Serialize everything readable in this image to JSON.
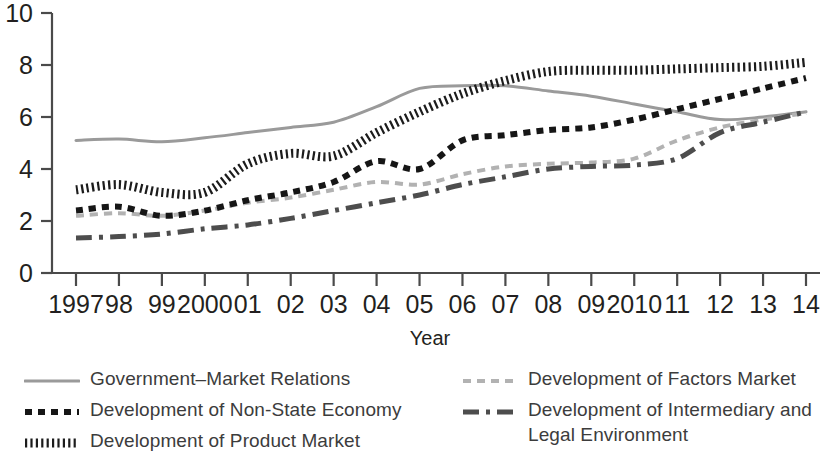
{
  "chart_data": {
    "type": "line",
    "title": "",
    "xlabel": "Year",
    "ylabel": "",
    "x": [
      1997,
      1998,
      1999,
      2000,
      2001,
      2002,
      2003,
      2004,
      2005,
      2006,
      2007,
      2008,
      2009,
      2010,
      2011,
      2012,
      2013,
      2014
    ],
    "categories": [
      "1997",
      "98",
      "99",
      "2000",
      "01",
      "02",
      "03",
      "04",
      "05",
      "06",
      "07",
      "08",
      "09",
      "2010",
      "11",
      "12",
      "13",
      "14"
    ],
    "xtick_labels": [
      "1997",
      "98",
      "99",
      "2000",
      "01",
      "02",
      "03",
      "04",
      "05",
      "06",
      "07",
      "08",
      "09",
      "2010",
      "11",
      "12",
      "13",
      "14"
    ],
    "ytick_labels": [
      "0",
      "2",
      "4",
      "6",
      "8",
      "10"
    ],
    "yticks": [
      0,
      2,
      4,
      6,
      8,
      10
    ],
    "ylim": [
      0,
      10
    ],
    "grid": false,
    "legend_position": "below-two-columns",
    "series": [
      {
        "name": "Government-Market Relations",
        "style": "solid",
        "color": "#9a9a9a",
        "width": 3,
        "values": [
          5.1,
          5.15,
          5.05,
          5.2,
          5.4,
          5.6,
          5.8,
          6.4,
          7.1,
          7.2,
          7.2,
          7.0,
          6.8,
          6.5,
          6.2,
          5.9,
          6.0,
          6.2
        ]
      },
      {
        "name": "Development of Non-State Economy",
        "style": "dotted-square",
        "color": "#161616",
        "width": 6,
        "values": [
          2.4,
          2.55,
          2.2,
          2.4,
          2.8,
          3.1,
          3.5,
          4.3,
          4.0,
          5.1,
          5.3,
          5.5,
          5.6,
          5.9,
          6.3,
          6.7,
          7.1,
          7.5
        ]
      },
      {
        "name": "Development of Product Market",
        "style": "hatched",
        "color": "#1c1c1c",
        "width": 9,
        "values": [
          3.2,
          3.4,
          3.1,
          3.1,
          4.2,
          4.6,
          4.5,
          5.4,
          6.2,
          6.9,
          7.4,
          7.75,
          7.8,
          7.8,
          7.85,
          7.9,
          7.95,
          8.1
        ]
      },
      {
        "name": "Development of Factors Market",
        "style": "dashed-light",
        "color": "#b2b2b2",
        "width": 4,
        "values": [
          2.2,
          2.3,
          2.2,
          2.4,
          2.7,
          2.9,
          3.2,
          3.5,
          3.4,
          3.8,
          4.1,
          4.2,
          4.25,
          4.4,
          5.1,
          5.6,
          5.9,
          6.15
        ]
      },
      {
        "name": "Development of Intermediary and Legal Environment",
        "style": "dash-dot",
        "color": "#4d4d4d",
        "width": 5,
        "values": [
          1.35,
          1.4,
          1.5,
          1.7,
          1.85,
          2.1,
          2.4,
          2.7,
          3.0,
          3.4,
          3.7,
          4.0,
          4.1,
          4.15,
          4.4,
          5.4,
          5.8,
          6.2
        ]
      }
    ]
  },
  "axes": {
    "x_axis_title": "Year"
  },
  "legend": {
    "left_column": [
      {
        "label": "Government–Market Relations",
        "marker": "solid-grey-line",
        "series_index": 0
      },
      {
        "label": "Development of Non-State Economy",
        "marker": "black-square-dotted-line",
        "series_index": 1
      },
      {
        "label": "Development of Product Market",
        "marker": "black-hatched-line",
        "series_index": 2
      }
    ],
    "right_column": [
      {
        "label": "Development of Factors Market",
        "marker": "light-grey-dashed-line",
        "series_index": 3
      },
      {
        "label": "Development of Intermediary and\nLegal Environment",
        "marker": "dark-dash-dot-line",
        "series_index": 4
      }
    ]
  }
}
